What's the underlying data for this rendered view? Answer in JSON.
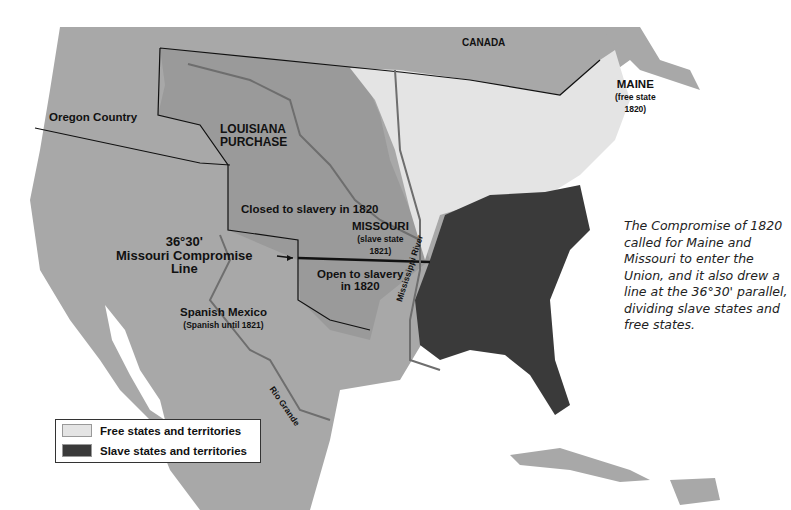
{
  "map": {
    "title_labels": {
      "canada": "CANADA",
      "oregon": "Oregon Country",
      "louisiana_line1": "LOUISIANA",
      "louisiana_line2": "PURCHASE",
      "closed": "Closed to slavery in 1820",
      "missouri": "MISSOURI",
      "missouri_sub1": "(slave state",
      "missouri_sub2": "1821)",
      "open_line1": "Open to slavery",
      "open_line2": "in 1820",
      "compromise_line1": "36°30'",
      "compromise_line2": "Missouri Compromise",
      "compromise_line3": "Line",
      "spanish": "Spanish Mexico",
      "spanish_sub": "(Spanish until 1821)",
      "maine": "MAINE",
      "maine_sub1": "(free state",
      "maine_sub2": "1820)",
      "mississippi": "Mississippi River",
      "rio": "Rio Grande"
    },
    "colors": {
      "water": "#ffffff",
      "other_land": "#a8a8a8",
      "louisiana": "#9a9a9a",
      "free": "#e4e4e4",
      "slave": "#3a3a3a",
      "river": "#6e6e6e"
    }
  },
  "legend": {
    "items": [
      {
        "label": "Free states and territories",
        "color": "#e4e4e4"
      },
      {
        "label": "Slave states and territories",
        "color": "#3a3a3a"
      }
    ]
  },
  "caption": "The Compromise of 1820 called for Maine and Missouri to enter the Union, and it also drew a line at the 36°30' parallel, dividing slave states and free states."
}
